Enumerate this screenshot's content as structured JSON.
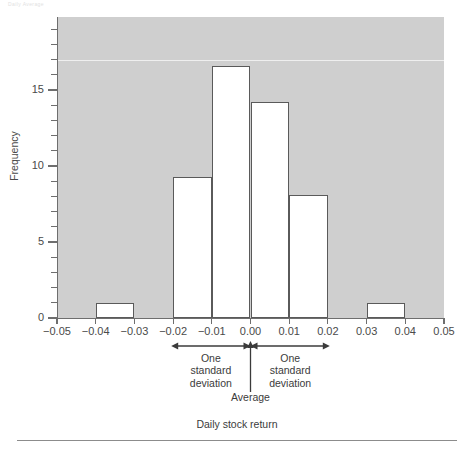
{
  "page": {
    "header_faint_text": "Daily Average"
  },
  "chart_data": {
    "type": "bar",
    "title": "",
    "subtitle": "",
    "xlabel": "Daily stock return",
    "ylabel": "Frequency",
    "xlim": [
      -0.05,
      0.05
    ],
    "ylim": [
      0,
      19.8
    ],
    "grid": true,
    "legend": false,
    "legend_position": "none",
    "bin_width": 0.01,
    "categories": [
      "-0.05 to -0.04",
      "-0.04 to -0.03",
      "-0.03 to -0.02",
      "-0.02 to -0.01",
      "-0.01 to 0.00",
      "0.00 to 0.01",
      "0.01 to 0.02",
      "0.02 to 0.03",
      "0.03 to 0.04",
      "0.04 to 0.05"
    ],
    "bin_starts": [
      -0.05,
      -0.04,
      -0.03,
      -0.02,
      -0.01,
      0.0,
      0.01,
      0.02,
      0.03,
      0.04
    ],
    "values": [
      0,
      1,
      0,
      9.3,
      16.6,
      14.2,
      8.1,
      0,
      1,
      0
    ],
    "x_tick_labels": [
      "−0.05",
      "−0.04",
      "−0.03",
      "−0.02",
      "−0.01",
      "0.00",
      "0.01",
      "0.02",
      "0.03",
      "0.04",
      "0.05"
    ],
    "x_tick_values": [
      -0.05,
      -0.04,
      -0.03,
      -0.02,
      -0.01,
      0,
      0.01,
      0.02,
      0.03,
      0.04,
      0.05
    ],
    "y_tick_labels": [
      "0",
      "5",
      "10",
      "15"
    ],
    "y_tick_values": [
      0,
      5,
      10,
      15
    ],
    "y_minor_tick_step": 1,
    "gridline_values": [
      17
    ],
    "colors": {
      "plot_background": "#cfcfcf",
      "bar_fill": "#ffffff",
      "bar_outline": "#5a5a5a",
      "axis": "#6e6e6e",
      "gridline": "#efefef",
      "text": "#3b3b3b"
    },
    "annotations": [
      {
        "name": "one-standard-deviation-left",
        "text": "One\nstandard\ndeviation",
        "line1": "One",
        "line2": "standard",
        "line3": "deviation",
        "from": -0.0205,
        "to": 0.0
      },
      {
        "name": "one-standard-deviation-right",
        "text": "One\nstandard\ndeviation",
        "line1": "One",
        "line2": "standard",
        "line3": "deviation",
        "from": 0.0,
        "to": 0.0205
      },
      {
        "name": "average-marker",
        "text": "Average",
        "at": 0.0
      }
    ]
  }
}
